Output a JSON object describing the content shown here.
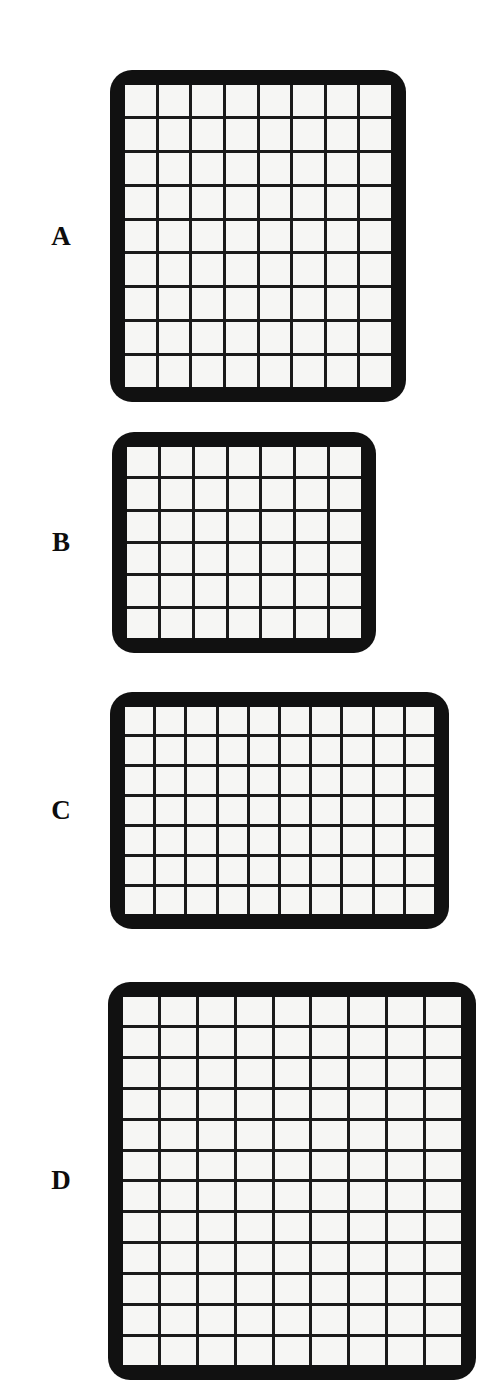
{
  "figure": {
    "background_color": "#ffffff",
    "frame_color": "#111111",
    "gridline_color": "#1a1a1a",
    "cell_color": "#f6f6f4",
    "label_color": "#0d0d0d"
  },
  "panels": [
    {
      "label": "A",
      "columns": 8,
      "rows": 9,
      "cell_count": 72,
      "frame": {
        "x": 110,
        "y": 70,
        "width": 296,
        "height": 332
      },
      "label_pos": {
        "x": 38,
        "y": 223
      }
    },
    {
      "label": "B",
      "columns": 7,
      "rows": 6,
      "cell_count": 42,
      "frame": {
        "x": 112,
        "y": 432,
        "width": 264,
        "height": 221
      },
      "label_pos": {
        "x": 38,
        "y": 529
      }
    },
    {
      "label": "C",
      "columns": 10,
      "rows": 7,
      "cell_count": 70,
      "frame": {
        "x": 110,
        "y": 692,
        "width": 339,
        "height": 237
      },
      "label_pos": {
        "x": 38,
        "y": 797
      }
    },
    {
      "label": "D",
      "columns": 9,
      "rows": 12,
      "cell_count": 108,
      "frame": {
        "x": 108,
        "y": 982,
        "width": 368,
        "height": 398
      },
      "label_pos": {
        "x": 38,
        "y": 1167
      }
    }
  ],
  "chart_data": {
    "type": "table",
    "title": "",
    "categories": [
      "A",
      "B",
      "C",
      "D"
    ],
    "series": [
      {
        "name": "columns",
        "values": [
          8,
          7,
          10,
          9
        ]
      },
      {
        "name": "rows",
        "values": [
          9,
          6,
          7,
          12
        ]
      },
      {
        "name": "total_cells",
        "values": [
          72,
          42,
          70,
          108
        ]
      }
    ],
    "xlabel": "",
    "ylabel": ""
  }
}
